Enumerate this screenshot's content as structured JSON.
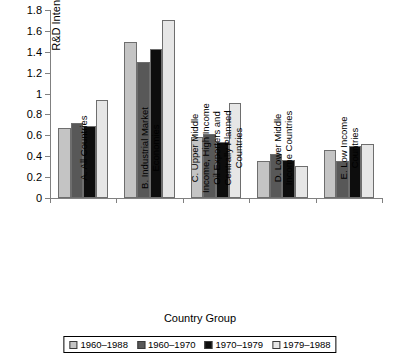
{
  "chart_data": {
    "type": "bar",
    "title": "",
    "xlabel": "Country Group",
    "ylabel": "R&D Intensity (%)",
    "ylim": [
      0,
      1.8
    ],
    "yticks": [
      "0",
      "0.2",
      "0.4",
      "0.6",
      "0.8",
      "1",
      "1.2",
      "1.4",
      "1.6",
      "1.8"
    ],
    "ytick_values": [
      0,
      0.2,
      0.4,
      0.6,
      0.8,
      1.0,
      1.2,
      1.4,
      1.6,
      1.8
    ],
    "grid": false,
    "legend_position": "bottom",
    "categories": [
      "A. All Countries",
      "B. Industrial Market\nEconomies",
      "C. Upper Middle\nIncome, High Income\nOil Exporters and\nCentrally Planned\nCountries",
      "D. Lower Middle\nIncome Countries",
      "E. Low Income\nCountries"
    ],
    "series": [
      {
        "name": "1960–1988",
        "color": "#c4c4c4",
        "values": [
          0.67,
          1.49,
          0.58,
          0.35,
          0.46
        ]
      },
      {
        "name": "1960–1970",
        "color": "#585858",
        "values": [
          0.72,
          1.3,
          0.61,
          0.42,
          0.35
        ]
      },
      {
        "name": "1970–1979",
        "color": "#0d0d0d",
        "values": [
          0.69,
          1.43,
          0.54,
          0.36,
          0.5
        ]
      },
      {
        "name": "1979–1988",
        "color": "#e6e6e6",
        "values": [
          0.94,
          1.7,
          0.91,
          0.31,
          0.52
        ]
      }
    ]
  }
}
